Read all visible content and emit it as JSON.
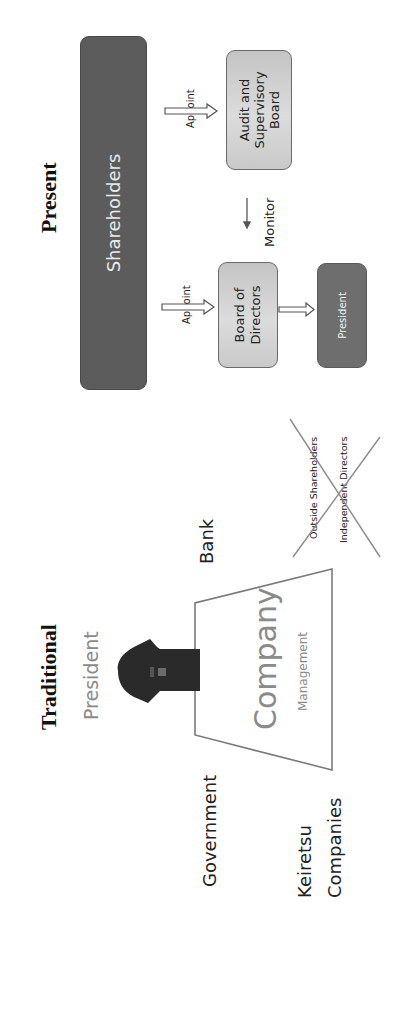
{
  "present": {
    "title": "Present",
    "shareholders": "Shareholders",
    "appoint_top": "Appoint",
    "appoint_bottom": "Appoint",
    "audit_board": [
      "Audit and",
      "Supervisory",
      "Board"
    ],
    "monitor": "Monitor",
    "board_of_directors": [
      "Board of",
      "Directors"
    ],
    "president": "President"
  },
  "traditional": {
    "title": "Traditional",
    "president": "President",
    "company": "Company",
    "management": "Management",
    "bank": "Bank",
    "government": "Government",
    "keiretsu": [
      "Keiretsu",
      "Companies"
    ],
    "outside_shareholders": "Outside Shareholders",
    "independent_directors": "Independent  Directors"
  },
  "colors": {
    "dark_box": "#5c5c5c",
    "light_box": "#d4d4d4",
    "president_box": "#6e6e6e",
    "line": "#7a7a7a",
    "cross": "#8a8a8a",
    "muted_text": "#8a8a8a"
  }
}
